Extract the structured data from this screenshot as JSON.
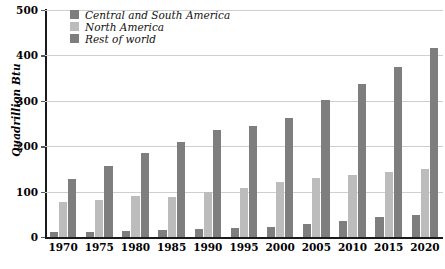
{
  "chart_data": {
    "type": "bar",
    "title": "",
    "subtitle": "",
    "xlabel": "",
    "ylabel": "Quadrillion Btu",
    "categories": [
      "1970",
      "1975",
      "1980",
      "1985",
      "1990",
      "1995",
      "2000",
      "2005",
      "2010",
      "2015",
      "2020"
    ],
    "ylim": [
      0,
      500
    ],
    "yticks": [
      0,
      100,
      200,
      300,
      400,
      500
    ],
    "ytick_labels": [
      "0",
      "100",
      "200",
      "300",
      "400",
      "500"
    ],
    "grid": true,
    "legend_position": "top-left-inside",
    "series": [
      {
        "name": "Central and South America",
        "color": "#7e7e7e",
        "values": [
          10,
          11,
          14,
          15,
          17,
          19,
          23,
          29,
          36,
          43,
          49
        ]
      },
      {
        "name": "North America",
        "color": "#bcbcbc",
        "values": [
          77,
          82,
          90,
          89,
          100,
          108,
          122,
          129,
          137,
          143,
          150
        ]
      },
      {
        "name": "Rest of world",
        "color": "#7e7e7e",
        "values": [
          127,
          156,
          184,
          209,
          236,
          244,
          263,
          302,
          338,
          375,
          417
        ]
      }
    ]
  },
  "legend": {
    "items": [
      {
        "label": "Central and South America",
        "color": "#7e7e7e"
      },
      {
        "label": "North America",
        "color": "#bcbcbc"
      },
      {
        "label": "Rest of world",
        "color": "#7e7e7e"
      }
    ]
  },
  "colors": {
    "dark_gray": "#7e7e7e",
    "light_gray": "#bcbcbc",
    "axis": "#1a1a1a",
    "gridline": "#cfcfcf",
    "background": "#ffffff"
  }
}
